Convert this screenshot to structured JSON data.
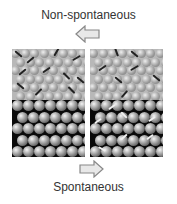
{
  "labels": {
    "top": "Non-spontaneous",
    "bottom": "Spontaneous"
  },
  "arrows": {
    "top": "left-arrow",
    "bottom": "right-arrow"
  },
  "panels": [
    {
      "name": "left-panel",
      "top_state": "disordered rods (dark) on gray sphere lattice",
      "bottom_state": "black background, ordered spheres"
    },
    {
      "name": "right-panel",
      "top_state": "fewer dark rods on gray sphere lattice",
      "bottom_state": "black background, spheres with white rods"
    }
  ],
  "colors": {
    "gray_bg": "#b8b8b8",
    "black_bg": "#0a0a0a",
    "dark_rod": "#222222",
    "white_rod": "#f0f0f0"
  }
}
